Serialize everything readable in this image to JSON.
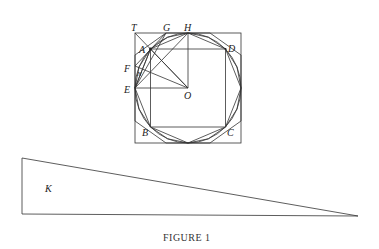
{
  "figure": {
    "caption": "FIGURE 1",
    "labels": {
      "T": "T",
      "G": "G",
      "H": "H",
      "A": "A",
      "D": "D",
      "F": "F",
      "N": "N",
      "E": "E",
      "O": "O",
      "B": "B",
      "C": "C",
      "K": "K"
    }
  }
}
